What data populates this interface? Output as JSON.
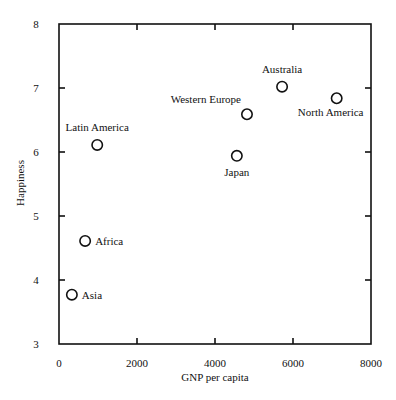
{
  "chart_data": {
    "type": "scatter",
    "title": "",
    "xlabel": "GNP per capita",
    "ylabel": "Happiness",
    "xlim": [
      0,
      8000
    ],
    "ylim": [
      3,
      8
    ],
    "xticks": [
      0,
      2000,
      4000,
      6000,
      8000
    ],
    "yticks": [
      3,
      4,
      5,
      6,
      7,
      8
    ],
    "grid": false,
    "legend": null,
    "marker": "open-circle",
    "points": [
      {
        "label": "Asia",
        "x": 330,
        "y": 3.77,
        "label_pos": "right"
      },
      {
        "label": "Africa",
        "x": 670,
        "y": 4.61,
        "label_pos": "right"
      },
      {
        "label": "Latin America",
        "x": 980,
        "y": 6.11,
        "label_pos": "above"
      },
      {
        "label": "Japan",
        "x": 4560,
        "y": 5.94,
        "label_pos": "below"
      },
      {
        "label": "Western Europe",
        "x": 4820,
        "y": 6.59,
        "label_pos": "above-left"
      },
      {
        "label": "Australia",
        "x": 5720,
        "y": 7.02,
        "label_pos": "above"
      },
      {
        "label": "North America",
        "x": 7120,
        "y": 6.84,
        "label_pos": "below"
      }
    ]
  },
  "layout": {
    "plot": {
      "left": 59,
      "top": 24,
      "right": 371,
      "bottom": 344
    },
    "colors": {
      "axis": "#111111",
      "marker": "#111111",
      "background": "#ffffff"
    }
  }
}
